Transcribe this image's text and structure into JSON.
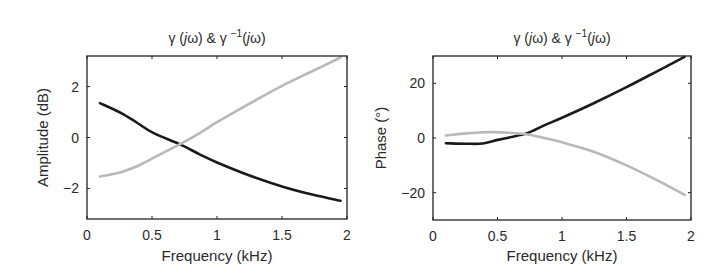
{
  "figure": {
    "background": "#ffffff",
    "line_colors": {
      "gamma": "#1a1a1a",
      "gamma_inverse": "#b8b8b8"
    }
  },
  "chart_data": [
    {
      "type": "line",
      "title": "γ (jω) & γ⁻¹(jω)",
      "title_parts": {
        "base": "γ (",
        "j": "j",
        "omega": "ω) & γ",
        "sup": "−1",
        "tail_open": "(",
        "j2": "j",
        "tail": "ω)"
      },
      "xlabel": "Frequency (kHz)",
      "ylabel": "Amplitude (dB)",
      "xlim": [
        0,
        2
      ],
      "ylim": [
        -3.2,
        3.2
      ],
      "xticks": [
        0,
        0.5,
        1,
        1.5,
        2
      ],
      "xtick_labels": [
        "0",
        "0.5",
        "1",
        "1.5",
        "2"
      ],
      "yticks": [
        -2,
        0,
        2
      ],
      "ytick_labels": [
        "−2",
        "0",
        "2"
      ],
      "grid": false,
      "legend": null,
      "x": [
        0.1,
        0.26,
        0.385,
        0.51,
        0.72,
        0.87,
        1.0,
        1.25,
        1.5,
        1.74,
        1.95
      ],
      "series": [
        {
          "name": "γ(jω)",
          "color": "#1a1a1a",
          "values": [
            1.35,
            0.97,
            0.58,
            0.18,
            -0.28,
            -0.67,
            -0.98,
            -1.49,
            -1.92,
            -2.25,
            -2.48
          ]
        },
        {
          "name": "γ⁻¹(jω)",
          "color": "#b8b8b8",
          "values": [
            -1.53,
            -1.36,
            -1.13,
            -0.8,
            -0.25,
            0.18,
            0.6,
            1.33,
            2.03,
            2.62,
            3.14
          ]
        }
      ]
    },
    {
      "type": "line",
      "title": "γ (jω) & γ⁻¹(jω)",
      "xlabel": "Frequency (kHz)",
      "ylabel": "Phase (°)",
      "xlim": [
        0,
        2
      ],
      "ylim": [
        -30,
        30
      ],
      "xticks": [
        0,
        0.5,
        1,
        1.5,
        2
      ],
      "xtick_labels": [
        "0",
        "0.5",
        "1",
        "1.5",
        "2"
      ],
      "yticks": [
        -20,
        0,
        20
      ],
      "ytick_labels": [
        "−20",
        "0",
        "20"
      ],
      "grid": false,
      "legend": null,
      "x": [
        0.1,
        0.26,
        0.385,
        0.51,
        0.72,
        0.87,
        1.0,
        1.25,
        1.5,
        1.74,
        1.95
      ],
      "series": [
        {
          "name": "γ(jω)",
          "color": "#1a1a1a",
          "values": [
            -1.9,
            -2.1,
            -2.0,
            -0.6,
            1.6,
            4.8,
            7.4,
            12.8,
            18.6,
            24.5,
            29.7
          ]
        },
        {
          "name": "γ⁻¹(jω)",
          "color": "#b8b8b8",
          "values": [
            0.9,
            1.7,
            2.1,
            2.1,
            1.4,
            -0.1,
            -1.6,
            -5.1,
            -10.0,
            -15.5,
            -20.8
          ]
        }
      ]
    }
  ],
  "layout": [
    {
      "box": {
        "x": 87,
        "y": 56,
        "w": 260,
        "h": 163
      },
      "ylabel_x": 43
    },
    {
      "box": {
        "x": 433,
        "y": 56,
        "w": 258,
        "h": 164
      },
      "ylabel_x": 381
    }
  ]
}
